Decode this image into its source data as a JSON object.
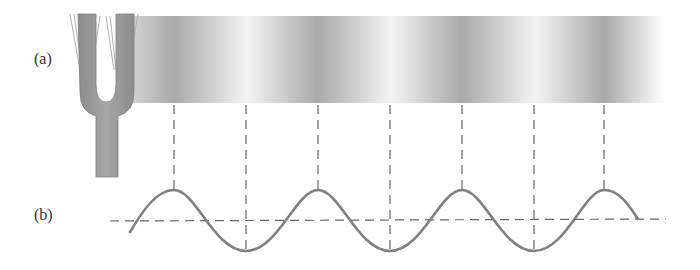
{
  "labels": {
    "a": "(a)",
    "b": "(b)"
  },
  "figure": {
    "parts": [
      "tuning-fork",
      "pressure-band",
      "vertical-reference-lines",
      "sine-wave",
      "equilibrium-line"
    ]
  },
  "colors": {
    "fork": "#9a9a9a",
    "wave": "#808080",
    "dashed": "#666666",
    "band_dark": "#a8a8a8",
    "band_light": "#f4f4f4"
  },
  "geometry": {
    "peaks_x": [
      174,
      318,
      462,
      604
    ],
    "troughs_x": [
      246,
      390,
      534
    ],
    "baseline_y": 221,
    "peak_y": 190,
    "trough_y": 251
  }
}
